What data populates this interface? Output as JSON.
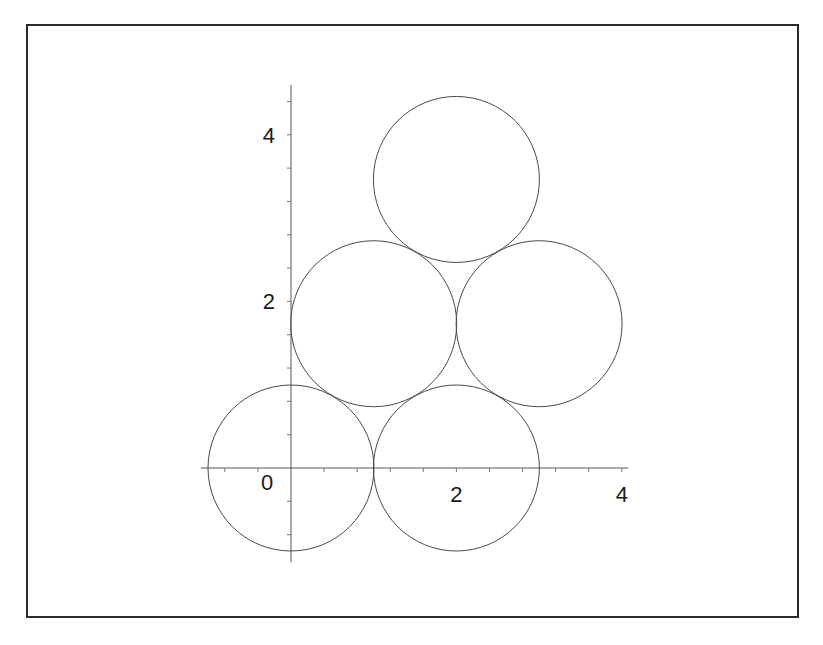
{
  "chart_data": {
    "type": "scatter",
    "title": "",
    "xlabel": "",
    "ylabel": "",
    "xlim": [
      -1.09,
      4.08
    ],
    "ylim": [
      -1.13,
      4.6
    ],
    "x_ticks_labeled": [
      "0",
      "2",
      "4"
    ],
    "y_ticks_labeled": [
      "2",
      "4"
    ],
    "minor_tick_step": 0.4,
    "grid": false,
    "legend": "none",
    "shapes": [
      {
        "name": "circle-1",
        "kind": "circle",
        "cx": 0,
        "cy": 0,
        "r": 1
      },
      {
        "name": "circle-2",
        "kind": "circle",
        "cx": 2,
        "cy": 0,
        "r": 1
      },
      {
        "name": "circle-3",
        "kind": "circle",
        "cx": 1,
        "cy": 1.732,
        "r": 1
      },
      {
        "name": "circle-4",
        "kind": "circle",
        "cx": 3,
        "cy": 1.732,
        "r": 1
      },
      {
        "name": "circle-5",
        "kind": "circle",
        "cx": 2,
        "cy": 3.464,
        "r": 1
      }
    ]
  }
}
